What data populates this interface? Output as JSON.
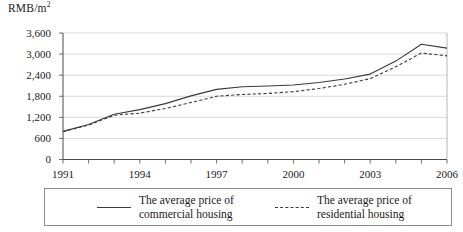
{
  "chart_data": {
    "type": "line",
    "title": "",
    "xlabel": "",
    "ylabel": "RMB/m2",
    "ylabel_prefix": "RMB/m",
    "ylabel_superscript": "2",
    "x": [
      1991,
      1992,
      1993,
      1994,
      1995,
      1996,
      1997,
      1998,
      1999,
      2000,
      2001,
      2002,
      2003,
      2004,
      2005,
      2006
    ],
    "xtick_labels": [
      "1991",
      "1994",
      "1997",
      "2000",
      "2003",
      "2006"
    ],
    "xtick_values": [
      1991,
      1994,
      1997,
      2000,
      2003,
      2006
    ],
    "xlim": [
      1991,
      2006
    ],
    "ytick_labels": [
      "0",
      "600",
      "1,200",
      "1,800",
      "2,400",
      "3,000",
      "3,600"
    ],
    "ytick_values": [
      0,
      600,
      1200,
      1800,
      2400,
      3000,
      3600
    ],
    "ylim": [
      0,
      3600
    ],
    "grid": "horizontal",
    "legend_position": "bottom",
    "series": [
      {
        "name": "The average price of commercial housing",
        "name_line1": "The average price of",
        "name_line2": "commercial housing",
        "style": "solid",
        "color": "#3a3a3a",
        "values": [
          800,
          995,
          1290,
          1420,
          1590,
          1810,
          1995,
          2070,
          2090,
          2120,
          2190,
          2290,
          2430,
          2800,
          3280,
          3170
        ]
      },
      {
        "name": "The average price of residential housing",
        "name_line1": "The average price of",
        "name_line2": "residential housing",
        "style": "dashed",
        "color": "#3a3a3a",
        "values": [
          790,
          980,
          1260,
          1320,
          1450,
          1620,
          1800,
          1850,
          1880,
          1930,
          2020,
          2140,
          2300,
          2640,
          3030,
          2950
        ]
      }
    ]
  },
  "legend": {
    "entries": [
      {
        "line1": "The average price of",
        "line2": "commercial housing",
        "style": "solid"
      },
      {
        "line1": "The average price of",
        "line2": "residential housing",
        "style": "dashed"
      }
    ]
  }
}
